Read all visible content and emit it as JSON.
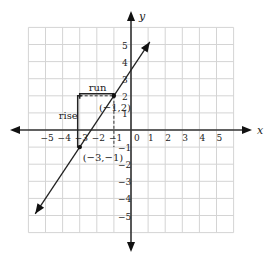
{
  "graph": {
    "x_axis_label": "x",
    "y_axis_label": "y",
    "x_range": [
      -6,
      6
    ],
    "y_range": [
      -6,
      6
    ],
    "x_ticks": [
      "−5",
      "−4",
      "−3",
      "−2",
      "−1",
      "0",
      "1",
      "2",
      "3",
      "4",
      "5"
    ],
    "x_tick_values": [
      -5,
      -4,
      -3,
      -2,
      -1,
      0,
      1,
      2,
      3,
      4,
      5
    ],
    "y_ticks": [
      "5",
      "4",
      "3",
      "2",
      "1",
      "−1",
      "−2",
      "−3",
      "−4",
      "−5"
    ],
    "y_tick_values": [
      5,
      4,
      3,
      2,
      1,
      -1,
      -2,
      -3,
      -4,
      -5
    ],
    "line": {
      "slope": 1.5,
      "intercept": 3.5,
      "from": [
        -5.6,
        -4.9
      ],
      "to": [
        1.1,
        5.15
      ]
    },
    "points": [
      {
        "label": "(−1,2)",
        "x": -1,
        "y": 2
      },
      {
        "label": "(−3,−1)",
        "x": -3,
        "y": -1
      }
    ],
    "rise_label": "rise",
    "run_label": "run"
  }
}
